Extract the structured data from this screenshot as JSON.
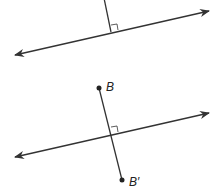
{
  "figure_top": {
    "line": {
      "x1": 15,
      "y1": 55,
      "x2": 209,
      "y2": 11
    },
    "perpendicular": {
      "x1": 104,
      "y1": -2,
      "x2": 111,
      "y2": 32
    },
    "right_angle": "M111,25 L117,24 L118,30"
  },
  "figure_bottom": {
    "line": {
      "x1": 15,
      "y1": 157,
      "x2": 209,
      "y2": 113
    },
    "segment": {
      "x1": 99,
      "y1": 88,
      "x2": 122,
      "y2": 180
    },
    "right_angle": "M111,127 L117,126 L118,132",
    "point_B": {
      "cx": 99,
      "cy": 88,
      "label": "B",
      "lx": 106,
      "ly": 91
    },
    "point_B_prime": {
      "cx": 122,
      "cy": 180,
      "label": "B′",
      "lx": 129,
      "ly": 186
    }
  },
  "colors": {
    "stroke": "#333333",
    "background": "#ffffff"
  }
}
